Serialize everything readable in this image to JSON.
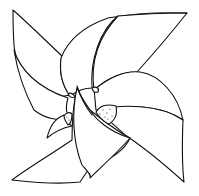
{
  "image": {
    "subject": "pinwheel line drawing",
    "colors": {
      "background": "#ffffff",
      "stroke": "#111111"
    },
    "blades": [
      "top-left",
      "top-right",
      "bottom-right",
      "bottom-left"
    ]
  }
}
